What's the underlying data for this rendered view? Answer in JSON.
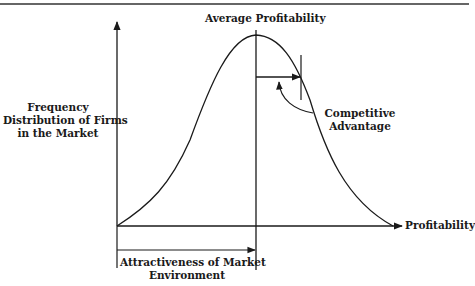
{
  "diagram": {
    "title_label": "Average Profitability",
    "y_axis_label": [
      "Frequency",
      "Distribution of Firms",
      "in the Market"
    ],
    "x_axis_label": "Profitability",
    "annotation_label": [
      "Competitive",
      "Advantage"
    ],
    "bracket_label": [
      "Attractiveness of Market",
      "Environment"
    ],
    "colors": {
      "ink": "#1a1a1a",
      "background": "#ffffff"
    }
  }
}
